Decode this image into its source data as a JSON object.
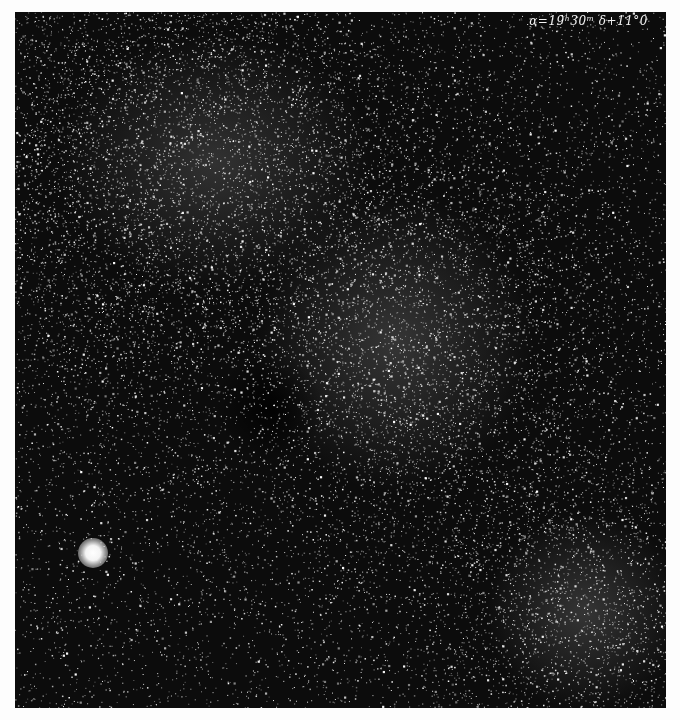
{
  "image": {
    "type": "astronomical photographic plate",
    "description": "Dense Milky Way star field with dark nebula lanes",
    "annotation": "α=19ʰ30ᵐ δ+11°0",
    "colors": {
      "background": "#0c0c0c",
      "margin": "#fdfdfd",
      "stars": "#ffffff"
    }
  },
  "features": {
    "bright_star": {
      "x": 77,
      "y": 540,
      "radius": 14
    },
    "dark_nebula": {
      "x": 250,
      "y": 390
    },
    "rich_field_regions": [
      {
        "x": 150,
        "y": 120
      },
      {
        "x": 380,
        "y": 320
      },
      {
        "x": 560,
        "y": 600
      }
    ]
  }
}
